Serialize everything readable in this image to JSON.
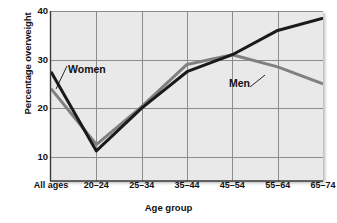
{
  "chart_data": {
    "type": "line",
    "title": "",
    "subtitle": "",
    "xlabel": "Age group",
    "ylabel": "Percentage overweight",
    "categories": [
      "All ages",
      "20–24",
      "25–34",
      "35–44",
      "45–54",
      "55–64",
      "65–74"
    ],
    "ylim": [
      5,
      40
    ],
    "xlim": [
      0,
      6
    ],
    "yticks": [
      10,
      20,
      30,
      40
    ],
    "ytick_labels": [
      "10",
      "20",
      "30",
      "40"
    ],
    "grid": true,
    "legend_position": "inline-annotation",
    "series": [
      {
        "name": "Women",
        "color": "#1a1a1a",
        "values": [
          27.5,
          11.2,
          20.0,
          27.5,
          31.0,
          36.0,
          38.5
        ]
      },
      {
        "name": "Men",
        "color": "#808080",
        "values": [
          24.0,
          12.5,
          20.3,
          29.0,
          31.0,
          28.5,
          25.0
        ]
      }
    ],
    "annotations": [
      {
        "text": "Women",
        "series": "Women",
        "points_to_category": "All ages"
      },
      {
        "text": "Men",
        "series": "Men",
        "points_to_category": "45–54"
      }
    ]
  },
  "axes": {
    "y_tick_labels": [
      "40",
      "30",
      "20",
      "10"
    ],
    "x_tick_labels": [
      "All ages",
      "20–24",
      "25–34",
      "35–44",
      "45–54",
      "55–64",
      "65–74"
    ],
    "y_axis_title": "Percentage overweight",
    "x_axis_title": "Age group"
  },
  "colors": {
    "plot_background": "#e9e9e9",
    "gridline": "#8c8c8c",
    "axis_line": "#3a3a3a",
    "women_line": "#1a1a1a",
    "men_line": "#808080",
    "text": "#111111",
    "page_background": "#ffffff"
  },
  "labels": {
    "women": "Women",
    "men": "Men"
  }
}
